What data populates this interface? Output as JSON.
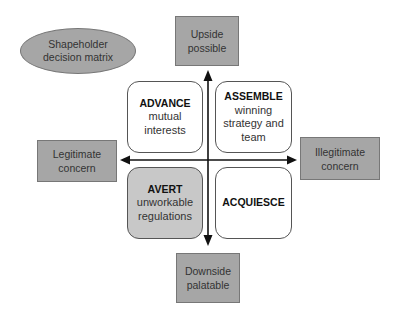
{
  "title": {
    "line1": "Shapeholder",
    "line2": "decision matrix"
  },
  "axes": {
    "top": {
      "line1": "Upside",
      "line2": "possible"
    },
    "bottom": {
      "line1": "Downside",
      "line2": "palatable"
    },
    "left": {
      "line1": "Legitimate",
      "line2": "concern"
    },
    "right": {
      "line1": "Illegitimate",
      "line2": "concern"
    }
  },
  "quadrants": {
    "top_left": {
      "title": "ADVANCE",
      "line1": "mutual",
      "line2": "interests"
    },
    "top_right": {
      "title": "ASSEMBLE",
      "line1": "winning",
      "line2": "strategy and",
      "line3": "team"
    },
    "bottom_left": {
      "title": "AVERT",
      "line1": "unworkable",
      "line2": "regulations"
    },
    "bottom_right": {
      "title": "ACQUIESCE"
    }
  },
  "colors": {
    "gray_fill": "#a6a6a6",
    "avert_fill": "#c8c8c8",
    "axis": "#111111"
  }
}
